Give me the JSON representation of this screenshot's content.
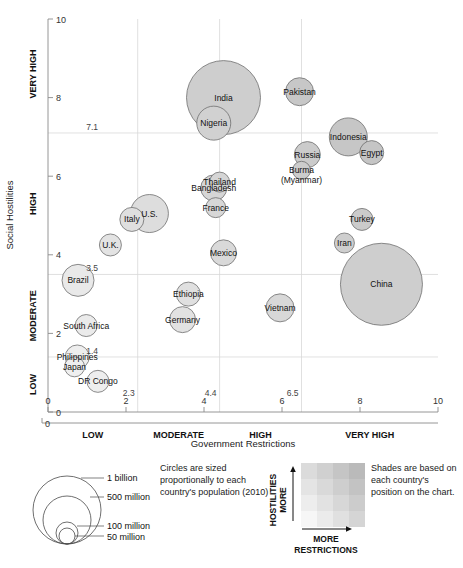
{
  "chart_data": {
    "type": "scatter",
    "title": "",
    "xlabel": "Government Restrictions",
    "ylabel": "Social Hostilities",
    "xlim": [
      0,
      10
    ],
    "ylim": [
      0,
      10
    ],
    "grid": true,
    "x_ticks": [
      "0",
      "2",
      "4",
      "6",
      "8",
      "10"
    ],
    "y_ticks": [
      "0",
      "2",
      "4",
      "6",
      "8",
      "10"
    ],
    "x_categories": [
      "LOW",
      "MODERATE",
      "HIGH",
      "VERY HIGH"
    ],
    "y_categories": [
      "LOW",
      "MODERATE",
      "HIGH",
      "VERY HIGH"
    ],
    "x_gridline_values": [
      "2.3",
      "4.4",
      "6.5"
    ],
    "y_gridline_values": [
      "1.4",
      "3.5",
      "7.1"
    ],
    "size_encoding": "population_2010",
    "points": [
      {
        "label": "India",
        "x": 4.5,
        "y": 8.0,
        "r": 37
      },
      {
        "label": "Nigeria",
        "x": 4.25,
        "y": 7.35,
        "r": 17
      },
      {
        "label": "Pakistan",
        "x": 6.45,
        "y": 8.15,
        "r": 14
      },
      {
        "label": "Indonesia",
        "x": 7.7,
        "y": 7.0,
        "r": 19
      },
      {
        "label": "Egypt",
        "x": 8.3,
        "y": 6.6,
        "r": 12
      },
      {
        "label": "Russia",
        "x": 6.65,
        "y": 6.55,
        "r": 13
      },
      {
        "label": "Burma\n(Myanmar)",
        "x": 6.5,
        "y": 6.15,
        "r": 9
      },
      {
        "label": "Thailand",
        "x": 4.4,
        "y": 5.85,
        "r": 10
      },
      {
        "label": "Bangladesh",
        "x": 4.25,
        "y": 5.7,
        "r": 13
      },
      {
        "label": "France",
        "x": 4.3,
        "y": 5.2,
        "r": 10
      },
      {
        "label": "U.S.",
        "x": 2.6,
        "y": 5.05,
        "r": 19
      },
      {
        "label": "Italy",
        "x": 2.15,
        "y": 4.9,
        "r": 12
      },
      {
        "label": "Turkey",
        "x": 8.05,
        "y": 4.9,
        "r": 11
      },
      {
        "label": "U.K.",
        "x": 1.6,
        "y": 4.25,
        "r": 11
      },
      {
        "label": "Iran",
        "x": 7.6,
        "y": 4.3,
        "r": 10
      },
      {
        "label": "Mexico",
        "x": 4.5,
        "y": 4.05,
        "r": 13
      },
      {
        "label": "China",
        "x": 8.55,
        "y": 3.25,
        "r": 41
      },
      {
        "label": "Brazil",
        "x": 0.77,
        "y": 3.35,
        "r": 16
      },
      {
        "label": "Ethiopia",
        "x": 3.6,
        "y": 3.0,
        "r": 12
      },
      {
        "label": "Vietnam",
        "x": 5.95,
        "y": 2.65,
        "r": 14
      },
      {
        "label": "Germany",
        "x": 3.45,
        "y": 2.35,
        "r": 13
      },
      {
        "label": "South Africa",
        "x": 0.98,
        "y": 2.2,
        "r": 11
      },
      {
        "label": "Philippines",
        "x": 0.75,
        "y": 1.4,
        "r": 12
      },
      {
        "label": "Japan",
        "x": 0.68,
        "y": 1.15,
        "r": 10
      },
      {
        "label": "DR Congo",
        "x": 1.28,
        "y": 0.78,
        "r": 11
      }
    ]
  },
  "axes": {
    "x_title": "Government Restrictions",
    "y_title": "Social Hostilities",
    "x_numbers": [
      "0",
      "2",
      "4",
      "6",
      "8",
      "10"
    ],
    "y_numbers": [
      "0",
      "2",
      "4",
      "6",
      "8",
      "10"
    ],
    "x_bands": [
      "LOW",
      "MODERATE",
      "HIGH",
      "VERY HIGH"
    ],
    "y_bands": [
      "LOW",
      "MODERATE",
      "HIGH",
      "VERY HIGH"
    ],
    "x_grid_labels": [
      "2.3",
      "4.4",
      "6.5"
    ],
    "y_grid_labels": [
      "1.4",
      "3.5",
      "7.1"
    ],
    "origin_label": "0"
  },
  "legend_size": {
    "items": [
      "1 billion",
      "500 million",
      "100 million",
      "50 million"
    ],
    "note": "Circles are sized proportionally to each country's population (2010)"
  },
  "legend_shade": {
    "note": "Shades are based on each country's position on the chart.",
    "y_caption_line1": "MORE",
    "y_caption_line2": "HOSTILITIES",
    "x_caption_line1": "MORE",
    "x_caption_line2": "RESTRICTIONS"
  },
  "colors": {
    "bubble_fill_dark": "#b9b9b9",
    "bubble_fill_light": "#f2f2f2",
    "bubble_stroke": "#6f6f6f",
    "gridline": "#d8d8d8",
    "axis": "#8a8a8a",
    "text": "#111111"
  }
}
